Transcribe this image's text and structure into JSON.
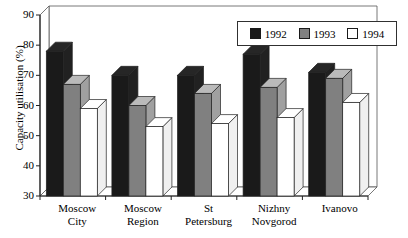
{
  "chart_data": {
    "type": "bar",
    "title": "",
    "xlabel": "",
    "ylabel": "Capacity utilisation (%)",
    "ylim": [
      30,
      90
    ],
    "yticks": [
      30,
      40,
      50,
      60,
      70,
      80,
      90
    ],
    "grid": false,
    "legend_position": "top-right",
    "style": "3d-clustered-column",
    "categories": [
      "Moscow City",
      "Moscow Region",
      "St Petersburg",
      "Nizhny Novgorod",
      "Ivanovo"
    ],
    "category_lines": [
      [
        "Moscow",
        "City"
      ],
      [
        "Moscow",
        "Region"
      ],
      [
        "St",
        "Petersburg"
      ],
      [
        "Nizhny",
        "Novgorod"
      ],
      [
        "Ivanovo",
        ""
      ]
    ],
    "series": [
      {
        "name": "1992",
        "color": "#1a1a1a",
        "values": [
          78,
          70,
          70,
          77,
          71
        ]
      },
      {
        "name": "1993",
        "color": "#808080",
        "values": [
          67,
          60,
          64,
          66,
          69
        ]
      },
      {
        "name": "1994",
        "color": "#ffffff",
        "values": [
          59,
          53,
          54,
          56,
          61
        ]
      }
    ]
  },
  "legend": {
    "items": [
      {
        "label": "1992",
        "color": "#1a1a1a"
      },
      {
        "label": "1993",
        "color": "#808080"
      },
      {
        "label": "1994",
        "color": "#ffffff"
      }
    ]
  },
  "axis": {
    "y_title": "Capacity utilisation (%)",
    "y_ticks": [
      "90",
      "80",
      "70",
      "60",
      "50",
      "40",
      "30"
    ]
  }
}
